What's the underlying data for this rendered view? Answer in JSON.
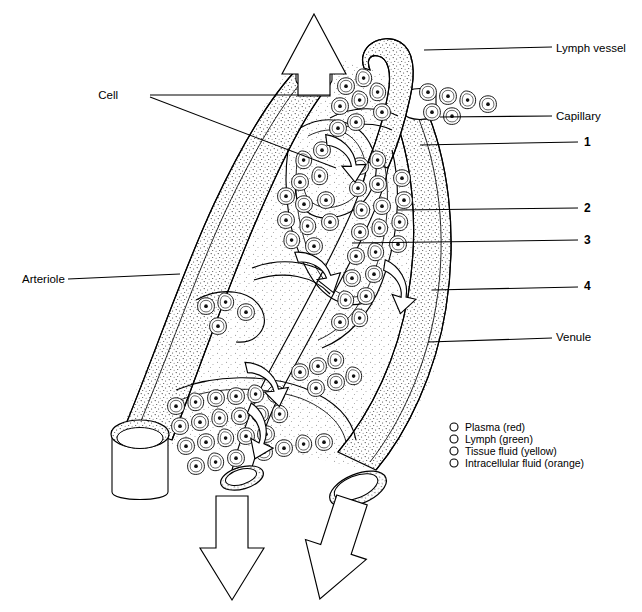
{
  "figure": {
    "background": "#ffffff",
    "ink": "#000000"
  },
  "labels": {
    "left": [
      {
        "id": "cell",
        "text": "Cell",
        "x": 118,
        "y": 99
      },
      {
        "id": "arteriole",
        "text": "Arteriole",
        "x": 22,
        "y": 283
      }
    ],
    "right": [
      {
        "id": "lymph-vessel",
        "text": "Lymph vessel",
        "x": 556,
        "y": 52
      },
      {
        "id": "capillary",
        "text": "Capillary",
        "x": 556,
        "y": 120
      },
      {
        "id": "callout-1",
        "text": "1",
        "x": 586,
        "y": 146
      },
      {
        "id": "callout-2",
        "text": "2",
        "x": 586,
        "y": 212
      },
      {
        "id": "callout-3",
        "text": "3",
        "x": 586,
        "y": 244
      },
      {
        "id": "callout-4",
        "text": "4",
        "x": 586,
        "y": 290
      },
      {
        "id": "venule",
        "text": "Venule",
        "x": 556,
        "y": 341
      }
    ]
  },
  "legend": {
    "x": 450,
    "y": 424,
    "marker": "open-circle",
    "items": [
      {
        "label": "Plasma (red)",
        "fluid": "plasma",
        "color_word": "red"
      },
      {
        "label": "Lymph (green)",
        "fluid": "lymph",
        "color_word": "green"
      },
      {
        "label": "Tissue fluid (yellow)",
        "fluid": "tissue fluid",
        "color_word": "yellow"
      },
      {
        "label": "Intracellular fluid (orange)",
        "fluid": "intracellular fluid",
        "color_word": "orange"
      }
    ]
  },
  "flow_arrows": [
    {
      "id": "arteriole-inflow",
      "direction": "up",
      "kind": "outline-arrow"
    },
    {
      "id": "venule-outflow",
      "direction": "down",
      "kind": "outline-arrow"
    },
    {
      "id": "lymph-outflow",
      "direction": "down",
      "kind": "outline-arrow"
    },
    {
      "id": "exchange-arrow-1",
      "direction": "down-right",
      "kind": "block-arrow"
    },
    {
      "id": "exchange-arrow-2",
      "direction": "down-right",
      "kind": "block-arrow"
    },
    {
      "id": "exchange-arrow-3",
      "direction": "down-right",
      "kind": "block-arrow"
    },
    {
      "id": "exchange-arrow-4",
      "direction": "down-right",
      "kind": "block-arrow"
    },
    {
      "id": "exchange-arrow-5",
      "direction": "down-right",
      "kind": "block-arrow"
    }
  ],
  "vessel_ends": [
    {
      "id": "arteriole-cut-end",
      "shape": "cut-cylinder"
    },
    {
      "id": "venule-cut-end",
      "shape": "cut-cylinder"
    },
    {
      "id": "lymph-cut-end",
      "shape": "cut-cylinder"
    }
  ]
}
